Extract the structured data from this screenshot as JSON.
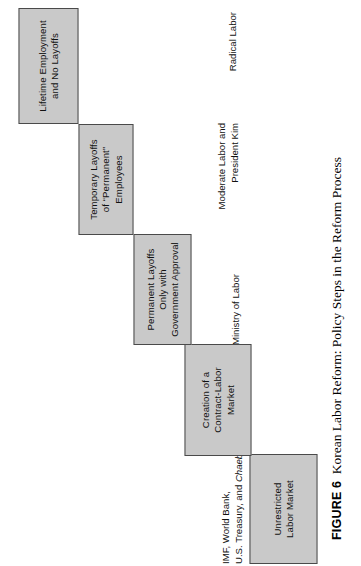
{
  "figure": {
    "number_label": "FIGURE 6",
    "title": "Korean Labor Reform: Policy Steps in the Reform Process",
    "orientation": "rotated-90-ccw",
    "box_fill_color": "#c9c9c9",
    "box_border_color": "#4a4a4a",
    "page_background": "#ffffff"
  },
  "steps": [
    {
      "id": "step-1",
      "order": 1,
      "label": "Unrestricted\nLabor Market",
      "actor": "IMF, World Bank,\nU.S. Treasury, and ",
      "actor_italic": "Chaebols"
    },
    {
      "id": "step-2",
      "order": 2,
      "label": "Creation of a\nContract-Labor\nMarket",
      "actor": ""
    },
    {
      "id": "step-3",
      "order": 3,
      "label": "Permanent Layoffs\nOnly with\nGovernment Approval",
      "actor": "Ministry of Labor"
    },
    {
      "id": "step-4",
      "order": 4,
      "label": "Temporary Layoffs\nof “Permanent”\nEmployees",
      "actor": "Moderate Labor and\nPresident Kim"
    },
    {
      "id": "step-5",
      "order": 5,
      "label": "Lifetime Employment\nand No Layoffs",
      "actor": "Radical Labor"
    }
  ],
  "chart_data": {
    "type": "diagram-staircase",
    "title": "Korean Labor Reform: Policy Steps in the Reform Process",
    "categories": [
      "Lifetime Employment and No Layoffs",
      "Temporary Layoffs of “Permanent” Employees",
      "Permanent Layoffs Only with Government Approval",
      "Creation of a Contract-Labor Market",
      "Unrestricted Labor Market"
    ],
    "values": [
      1,
      2,
      3,
      4,
      5
    ],
    "actors": [
      "Radical Labor",
      "Moderate Labor and President Kim",
      "Ministry of Labor",
      "",
      "IMF, World Bank, U.S. Treasury, and Chaebols"
    ],
    "xlabel": "",
    "ylabel": "Degree of labor-market deregulation",
    "legend": []
  }
}
